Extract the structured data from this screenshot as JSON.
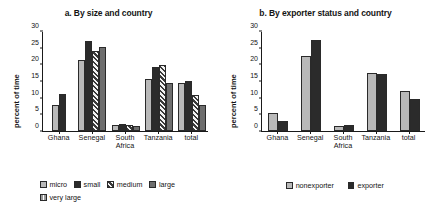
{
  "figure": {
    "background": "#ffffff",
    "colors": {
      "micro": "#b9b9b9",
      "small": "#2b2b2b",
      "medium": "#3a3a3a",
      "large": "#6e6e6e",
      "very_large": "#8f8f8f",
      "nonexporter": "#b9b9b9",
      "exporter": "#2b2b2b",
      "axis": "#1a1a1a"
    }
  },
  "panel_a": {
    "title": "a. By size and country",
    "ylabel": "percent of time",
    "yticks": [
      "0",
      "5",
      "10",
      "15",
      "20",
      "25",
      "30"
    ],
    "categories": [
      "Ghana",
      "Senegal",
      "South Africa",
      "Tanzania",
      "total"
    ],
    "category_lines": [
      [
        "Ghana"
      ],
      [
        "Senegal"
      ],
      [
        "South",
        "Africa"
      ],
      [
        "Tanzania"
      ],
      [
        "total"
      ]
    ],
    "legend": [
      {
        "label": "micro",
        "key": "micro"
      },
      {
        "label": "small",
        "key": "small"
      },
      {
        "label": "medium",
        "key": "medium"
      },
      {
        "label": "large",
        "key": "large"
      },
      {
        "label": "very large",
        "key": "very_large"
      }
    ]
  },
  "panel_b": {
    "title": "b. By exporter status and country",
    "ylabel": "percent of time",
    "yticks": [
      "0",
      "5",
      "10",
      "15",
      "20",
      "25",
      "30"
    ],
    "categories": [
      "Ghana",
      "Senegal",
      "South Africa",
      "Tanzania",
      "total"
    ],
    "category_lines": [
      [
        "Ghana"
      ],
      [
        "Senegal"
      ],
      [
        "South",
        "Africa"
      ],
      [
        "Tanzania"
      ],
      [
        "total"
      ]
    ],
    "legend": [
      {
        "label": "nonexporter",
        "key": "nonexporter"
      },
      {
        "label": "exporter",
        "key": "exporter"
      }
    ]
  },
  "chart_data": [
    {
      "type": "bar",
      "id": "panel_a",
      "title": "a. By size and country",
      "xlabel": "",
      "ylabel": "percent of time",
      "ylim": [
        0,
        30
      ],
      "yticks": [
        0,
        5,
        10,
        15,
        20,
        25,
        30
      ],
      "grid": false,
      "legend_position": "bottom-left",
      "categories": [
        "Ghana",
        "Senegal",
        "South Africa",
        "Tanzania",
        "total"
      ],
      "series": [
        {
          "name": "micro",
          "values": [
            7.8,
            21.5,
            1.8,
            15.8,
            14.7
          ]
        },
        {
          "name": "small",
          "values": [
            11.1,
            27.3,
            2.2,
            19.5,
            15.2
          ]
        },
        {
          "name": "medium",
          "values": [
            null,
            24.2,
            1.7,
            20.1,
            10.9
          ]
        },
        {
          "name": "large",
          "values": [
            null,
            25.6,
            1.5,
            14.5,
            8.0
          ]
        },
        {
          "name": "very large",
          "values": [
            null,
            null,
            null,
            null,
            null
          ]
        }
      ]
    },
    {
      "type": "bar",
      "id": "panel_b",
      "title": "b. By exporter status and country",
      "xlabel": "",
      "ylabel": "percent of time",
      "ylim": [
        0,
        30
      ],
      "yticks": [
        0,
        5,
        10,
        15,
        20,
        25,
        30
      ],
      "grid": false,
      "legend_position": "bottom-center",
      "categories": [
        "Ghana",
        "Senegal",
        "South Africa",
        "Tanzania",
        "total"
      ],
      "series": [
        {
          "name": "nonexporter",
          "values": [
            5.5,
            22.6,
            1.4,
            17.7,
            12.2
          ]
        },
        {
          "name": "exporter",
          "values": [
            3.1,
            27.5,
            1.8,
            17.4,
            9.8
          ]
        }
      ]
    }
  ]
}
